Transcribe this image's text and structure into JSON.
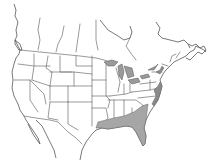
{
  "map": {
    "type": "species-range-map",
    "region": "North America (United States and southern Canada)",
    "colors": {
      "background": "#ffffff",
      "borders": "#6e6e6e",
      "lakes": "#9a9a9a",
      "range_fill": "#a6a6a6",
      "coastal_range": "#8a8a8a"
    },
    "range": {
      "label": "range",
      "areas": [
        "Southeastern coastal plain",
        "Florida",
        "Gulf Coast",
        "Atlantic coast strip"
      ]
    }
  }
}
